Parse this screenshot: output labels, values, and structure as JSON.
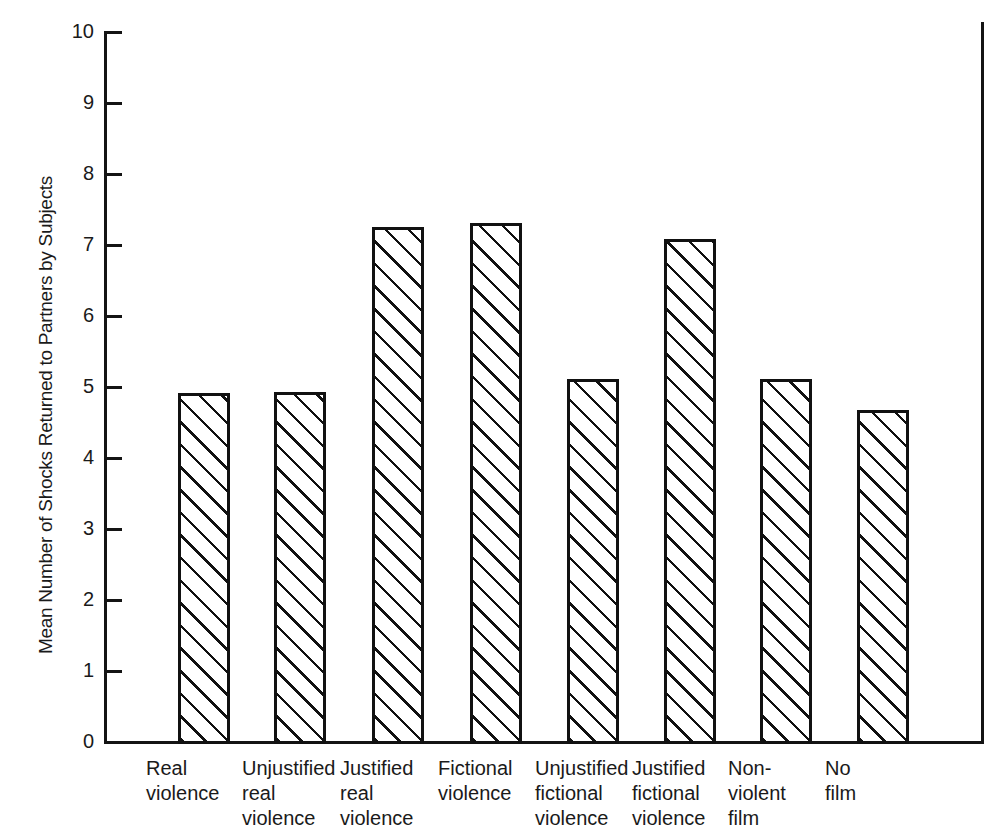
{
  "chart_data": {
    "type": "bar",
    "title": "",
    "subtitle": "",
    "xlabel": "",
    "ylabel": "Mean Number of Shocks Returned to Partners by Subjects",
    "ylim": [
      0,
      10
    ],
    "ytick_values": [
      0,
      1,
      2,
      3,
      4,
      5,
      6,
      7,
      8,
      9,
      10
    ],
    "ytick_labels": [
      "0",
      "1",
      "2",
      "3",
      "4",
      "5",
      "6",
      "7",
      "8",
      "9",
      "10"
    ],
    "grid": false,
    "legend": null,
    "bar_style": {
      "fill": "diagonal-hatch",
      "hatch_angle_deg": 45,
      "edge_color": "#111111",
      "face_color": "#ffffff"
    },
    "categories": [
      "Real\nviolence",
      "Unjustified\nreal\nviolence",
      "Justified\nreal\nviolence",
      "Fictional\nviolence",
      "Unjustified\nfictional\nviolence",
      "Justified\nfictional\nviolence",
      "Non-\nviolent\nfilm",
      "No\nfilm"
    ],
    "values": [
      4.92,
      4.93,
      7.25,
      7.31,
      5.11,
      7.08,
      5.11,
      4.68
    ],
    "annotations": []
  }
}
